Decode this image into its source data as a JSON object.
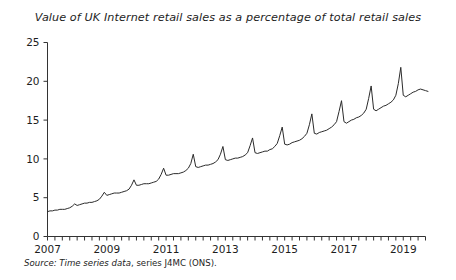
{
  "figure": {
    "title": "Value of UK Internet retail sales as a percentage of total retail sales",
    "source": {
      "label": "Source:",
      "dataset": " Time series data",
      "rest": ", series J4MC (ONS)."
    }
  },
  "chart_data": {
    "type": "line",
    "title": "Value of UK Internet retail sales as a percentage of total retail sales",
    "xlabel": "",
    "ylabel": "",
    "ylim": [
      0,
      25
    ],
    "xlim": [
      2007.0,
      2019.75
    ],
    "yticks": [
      0,
      5,
      10,
      15,
      20,
      25
    ],
    "ytick_labels": [
      "0",
      "5",
      "10",
      "15",
      "20",
      "25"
    ],
    "xticks": [
      2007,
      2009,
      2011,
      2013,
      2015,
      2017,
      2019
    ],
    "xtick_labels": [
      "2007",
      "2009",
      "2011",
      "2013",
      "2015",
      "2017",
      "2019"
    ],
    "minor_xtick_interval": 0.25,
    "grid": false,
    "legend": null,
    "line_color": "#2b2b2b",
    "line_width": 1.0,
    "units": "percent of total retail sales",
    "frequency": "monthly",
    "series": [
      {
        "name": "Internet retail sales as % of total retail sales",
        "x_start": 2007.0,
        "x_step": 0.0833333,
        "values": [
          3.2,
          3.3,
          3.3,
          3.4,
          3.4,
          3.5,
          3.5,
          3.5,
          3.6,
          3.7,
          3.9,
          4.2,
          4.0,
          4.1,
          4.2,
          4.3,
          4.3,
          4.4,
          4.4,
          4.5,
          4.6,
          4.8,
          5.2,
          5.7,
          5.3,
          5.4,
          5.5,
          5.6,
          5.6,
          5.6,
          5.7,
          5.8,
          5.9,
          6.1,
          6.6,
          7.3,
          6.6,
          6.6,
          6.7,
          6.8,
          6.8,
          6.8,
          6.9,
          7.0,
          7.1,
          7.4,
          8.0,
          8.8,
          7.9,
          7.9,
          8.0,
          8.1,
          8.1,
          8.1,
          8.2,
          8.3,
          8.5,
          8.8,
          9.4,
          10.6,
          9.0,
          8.9,
          9.0,
          9.1,
          9.2,
          9.2,
          9.3,
          9.4,
          9.6,
          9.9,
          10.6,
          11.6,
          9.9,
          9.8,
          9.9,
          10.0,
          10.1,
          10.1,
          10.2,
          10.3,
          10.5,
          10.8,
          11.7,
          12.7,
          10.8,
          10.7,
          10.8,
          10.9,
          11.0,
          11.0,
          11.2,
          11.3,
          11.6,
          12.0,
          13.0,
          14.1,
          11.9,
          11.8,
          11.9,
          12.1,
          12.2,
          12.3,
          12.4,
          12.6,
          12.9,
          13.3,
          14.4,
          15.8,
          13.3,
          13.2,
          13.4,
          13.5,
          13.6,
          13.7,
          13.9,
          14.1,
          14.4,
          14.8,
          16.1,
          17.5,
          14.8,
          14.6,
          14.8,
          15.0,
          15.1,
          15.3,
          15.4,
          15.6,
          15.9,
          16.4,
          17.8,
          19.4,
          16.4,
          16.2,
          16.4,
          16.6,
          16.8,
          16.9,
          17.1,
          17.3,
          17.6,
          18.2,
          19.7,
          21.8,
          18.2,
          18.0,
          18.2,
          18.4,
          18.6,
          18.7,
          18.9,
          19.0,
          18.9,
          18.8,
          18.7
        ]
      }
    ]
  }
}
